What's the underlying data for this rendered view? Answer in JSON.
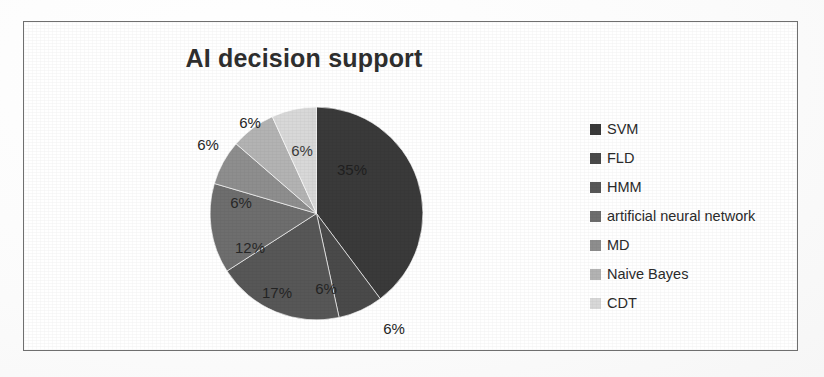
{
  "chart_data": {
    "type": "pie",
    "title": "AI decision support",
    "categories": [
      "SVM",
      "FLD",
      "HMM",
      "artificial neural network",
      "MD",
      "Naive Bayes",
      "CDT"
    ],
    "values": [
      35,
      6,
      17,
      12,
      6,
      6,
      6
    ],
    "value_labels": [
      "35%",
      "6%",
      "17%",
      "12%",
      "6%",
      "6%",
      "6%"
    ],
    "outer_labels": [
      "6%",
      "6%",
      "6%"
    ],
    "colors": [
      "#3a3a3a",
      "#4a4a4a",
      "#575757",
      "#6e6e6e",
      "#8e8e8e",
      "#b3b3b3",
      "#d8d8d8"
    ],
    "legend_position": "right",
    "grid": false,
    "xlabel": "",
    "ylabel": "",
    "units": "percent",
    "slices": [
      {
        "label": "SVM",
        "value": 35,
        "display": "35%",
        "color": "#3a3a3a"
      },
      {
        "label": "FLD",
        "value": 6,
        "display": "6%",
        "color": "#4a4a4a"
      },
      {
        "label": "HMM",
        "value": 17,
        "display": "17%",
        "color": "#575757"
      },
      {
        "label": "artificial neural network",
        "value": 12,
        "display": "12%",
        "color": "#6e6e6e"
      },
      {
        "label": "MD",
        "value": 6,
        "display": "6%",
        "color": "#8e8e8e"
      },
      {
        "label": "Naive Bayes",
        "value": 6,
        "display": "6%",
        "color": "#b3b3b3"
      },
      {
        "label": "CDT",
        "value": 6,
        "display": "6%",
        "color": "#d8d8d8"
      }
    ]
  },
  "chart": {
    "title": "AI decision support"
  },
  "legend": {
    "items": [
      {
        "label": "SVM",
        "color": "#3a3a3a"
      },
      {
        "label": "FLD",
        "color": "#4a4a4a"
      },
      {
        "label": "HMM",
        "color": "#575757"
      },
      {
        "label": "artificial neural network",
        "color": "#6e6e6e"
      },
      {
        "label": "MD",
        "color": "#8e8e8e"
      },
      {
        "label": "Naive Bayes",
        "color": "#b3b3b3"
      },
      {
        "label": "CDT",
        "color": "#d8d8d8"
      }
    ]
  },
  "labels": {
    "svm": "35%",
    "fld_inner": "6%",
    "fld_outer": "6%",
    "hmm": "17%",
    "ann": "12%",
    "md": "6%",
    "naive_bayes_outer": "6%",
    "cdt_outer": "6%",
    "cdt_inner": "6%"
  }
}
